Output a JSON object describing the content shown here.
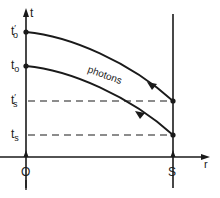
{
  "diagram": {
    "type": "spacetime-diagram",
    "axes": {
      "vertical_label": "t",
      "horizontal_label": "r"
    },
    "observer": {
      "label": "O"
    },
    "source": {
      "label": "S"
    },
    "time_marks": {
      "t_o_prime": {
        "base": "t",
        "sub": "o",
        "prime": "′"
      },
      "t_o": {
        "base": "t",
        "sub": "o"
      },
      "t_s_prime": {
        "base": "t",
        "sub": "s",
        "prime": "′"
      },
      "t_s": {
        "base": "t",
        "sub": "s"
      }
    },
    "curve_label": "photons",
    "colors": {
      "ink": "#1a1a1a",
      "background": "#ffffff"
    }
  }
}
